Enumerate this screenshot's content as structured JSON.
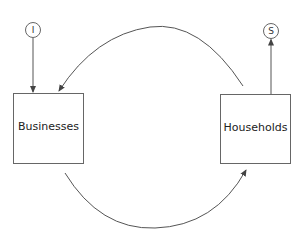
{
  "diagram": {
    "type": "circular-flow",
    "nodes": [
      {
        "id": "businesses",
        "label": "Businesses"
      },
      {
        "id": "households",
        "label": "Households"
      }
    ],
    "injection": {
      "label": "I",
      "target": "businesses"
    },
    "withdrawal": {
      "label": "S",
      "source": "households"
    },
    "flows": [
      {
        "from": "households",
        "to": "businesses",
        "path": "top-arc"
      },
      {
        "from": "businesses",
        "to": "households",
        "path": "bottom-arc"
      },
      {
        "from": "injection",
        "to": "businesses",
        "path": "straight"
      },
      {
        "from": "households",
        "to": "withdrawal",
        "path": "straight"
      }
    ],
    "colors": {
      "stroke": "#555555",
      "text": "#222222",
      "background": "#ffffff"
    }
  }
}
